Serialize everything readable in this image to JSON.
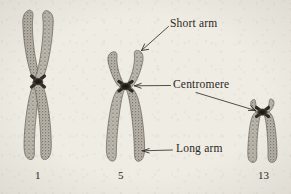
{
  "figure": {
    "background_color": "#efece4",
    "ink_color": "#2b2722",
    "chromatid_fill": "#9a958c",
    "centromere_color": "#201c18"
  },
  "labels": {
    "short_arm": "Short arm",
    "centromere": "Centromere",
    "long_arm": "Long arm"
  },
  "chromosomes": [
    {
      "number": "1",
      "type": "metacentric",
      "centromere_position": "middle",
      "short_arm_length": "long",
      "long_arm_length": "long"
    },
    {
      "number": "5",
      "type": "submetacentric",
      "centromere_position": "upper",
      "short_arm_length": "short",
      "long_arm_length": "long"
    },
    {
      "number": "13",
      "type": "acrocentric",
      "centromere_position": "near-top",
      "short_arm_length": "very short",
      "long_arm_length": "medium"
    }
  ]
}
